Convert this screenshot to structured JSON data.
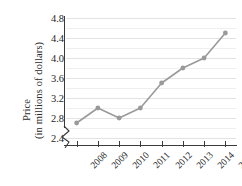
{
  "chart_data": {
    "type": "line",
    "title": "",
    "xlabel": "",
    "ylabel": "Price (in millions of dollars)",
    "ylabel_lines": [
      "Price",
      "(in millions of dollars)"
    ],
    "categories": [
      "2008",
      "2009",
      "2010",
      "2011",
      "2012",
      "2013",
      "2014",
      "2015"
    ],
    "values": [
      2.7,
      3.0,
      2.8,
      3.0,
      3.5,
      3.8,
      4.0,
      4.5
    ],
    "ytick_labels": [
      "4.8",
      "4.4",
      "4.0",
      "3.6",
      "3.2",
      "2.8",
      "2.4"
    ],
    "ytick_values": [
      4.8,
      4.4,
      4.0,
      3.6,
      3.2,
      2.8,
      2.4
    ],
    "ylim": [
      2.4,
      4.8
    ],
    "grid": true,
    "minor_grid": true,
    "axis_break": true,
    "legend": "none",
    "marker": "circle",
    "series_color": "#9a9a9a",
    "grid_color": "#e3e3e3",
    "axis_color": "#3a3a3a",
    "text_color": "#1f1f1f"
  }
}
